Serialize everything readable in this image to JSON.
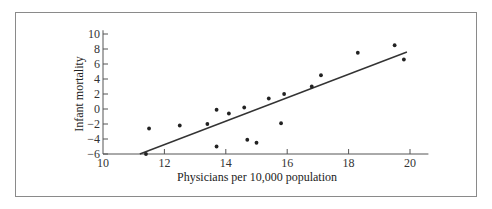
{
  "chart_data": {
    "type": "scatter",
    "title": "",
    "xlabel": "Physicians per 10,000 population",
    "ylabel": "Infant mortality",
    "xlim": [
      10,
      20.6
    ],
    "ylim": [
      -6,
      10.5
    ],
    "xticks": [
      10,
      12,
      14,
      16,
      18,
      20
    ],
    "yticks": [
      -6,
      -4,
      -2,
      0,
      2,
      4,
      6,
      8,
      10
    ],
    "grid": false,
    "legend": null,
    "series": [
      {
        "name": "observations",
        "x": [
          11.4,
          11.5,
          12.5,
          13.4,
          13.7,
          13.7,
          14.1,
          14.6,
          14.7,
          15.0,
          15.4,
          15.8,
          15.9,
          16.8,
          17.1,
          18.3,
          19.5,
          19.8
        ],
        "y": [
          -6.0,
          -2.6,
          -2.2,
          -2.0,
          -0.1,
          -5.0,
          -0.6,
          0.2,
          -4.1,
          -4.5,
          1.4,
          -1.9,
          2.0,
          3.0,
          4.5,
          7.5,
          8.5,
          6.6
        ]
      }
    ],
    "fit_line": {
      "x": [
        11.2,
        19.9
      ],
      "y": [
        -6.0,
        7.6
      ]
    }
  },
  "labels": {
    "xlabel": "Physicians per 10,000 population",
    "ylabel": "Infant mortality"
  },
  "colors": {
    "points": "#222222",
    "line": "#333333",
    "axis": "#555555",
    "frame": "#8a8a8a"
  }
}
